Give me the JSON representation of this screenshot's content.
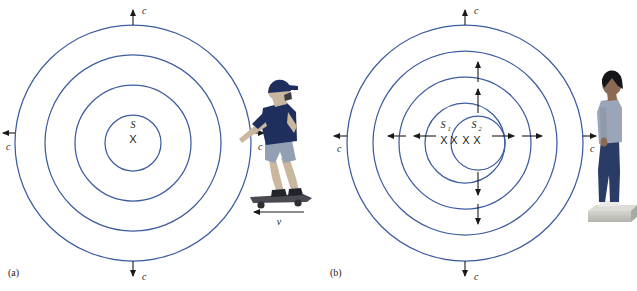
{
  "figure": {
    "wave_color": "#3c5ca0",
    "arrow_color": "#1a1a1a",
    "background": "#ffffff"
  },
  "panels": [
    {
      "id": "a",
      "label": "(a)",
      "description": "Moving source on skateboard emitting spherical wavefronts",
      "center": {
        "x": 133,
        "y": 143
      },
      "source_label": "S",
      "source_marker": "X",
      "wave_radii": [
        28,
        58,
        88,
        118
      ],
      "speed_arrows": [
        {
          "direction": "up",
          "label": "c"
        },
        {
          "direction": "down",
          "label": "c"
        },
        {
          "direction": "left",
          "label": "c"
        },
        {
          "direction": "right",
          "label": "c"
        }
      ],
      "observer": {
        "type": "skateboarder",
        "velocity_label": "v",
        "velocity_direction": "left",
        "shirt_color": "#1e2f5e",
        "shorts_color": "#93a0b4",
        "skin_color": "#d8c3ad",
        "cap_color": "#1e2f5e",
        "board_color": "#4a4a52"
      }
    },
    {
      "id": "b",
      "label": "(b)",
      "description": "Two stationary sources emitting spherical wavefronts",
      "center": {
        "x": 465,
        "y": 143
      },
      "source_labels": [
        "S",
        "S"
      ],
      "source_subscripts": [
        "1",
        "2"
      ],
      "source_markers": [
        "X",
        "X",
        "X",
        "X"
      ],
      "wave_radii": [
        118,
        92,
        66,
        40
      ],
      "inner_wave": {
        "cx": 478,
        "cy": 143,
        "r": 27
      },
      "speed_arrows": [
        {
          "direction": "up",
          "label": "c"
        },
        {
          "direction": "down",
          "label": "c"
        },
        {
          "direction": "left",
          "label": "c"
        },
        {
          "direction": "right",
          "label": "c"
        }
      ],
      "inner_arrows": {
        "up_count": 2,
        "down_count": 2,
        "left_count": 2,
        "right_count": 2
      },
      "observer": {
        "type": "standing-person",
        "shirt_color": "#9aa6b8",
        "pants_color": "#2a3c66",
        "hair_color": "#16161a",
        "skin_color": "#8a6a52",
        "platform_color": "#c6c6c0"
      }
    }
  ]
}
